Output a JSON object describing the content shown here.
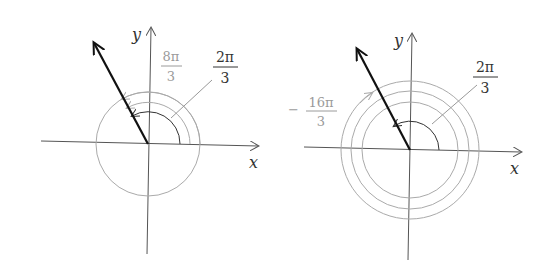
{
  "figures": [
    {
      "id": "left",
      "axis_labels": {
        "x": "x",
        "y": "y"
      },
      "angle_labels": [
        {
          "num": "8π",
          "den": "3",
          "sign": "",
          "color": "#9a9a9a"
        },
        {
          "num": "2π",
          "den": "3",
          "sign": "",
          "color": "#333333"
        }
      ]
    },
    {
      "id": "right",
      "axis_labels": {
        "x": "x",
        "y": "y"
      },
      "angle_labels": [
        {
          "num": "16π",
          "den": "3",
          "sign": "−",
          "color": "#9a9a9a"
        },
        {
          "num": "2π",
          "den": "3",
          "sign": "",
          "color": "#333333"
        }
      ]
    }
  ],
  "colors": {
    "axis": "#555555",
    "ray": "#111111",
    "arc_gray": "#aaaaaa",
    "arc_dark": "#333333"
  }
}
